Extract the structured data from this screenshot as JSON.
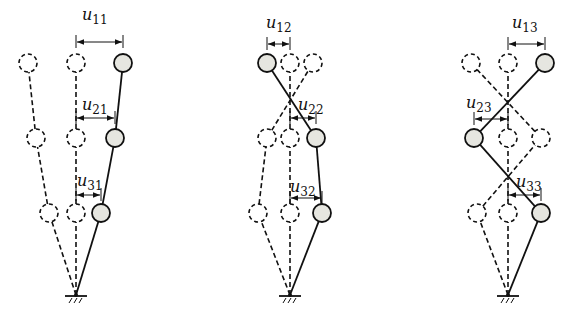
{
  "colors": {
    "stroke": "#111111",
    "mass_fill": "#e6e6e0",
    "background": "#ffffff"
  },
  "figures": [
    {
      "name": "mode-1",
      "base": [
        76,
        295
      ],
      "undeformed_x": 76,
      "rows_y": [
        63,
        138,
        213
      ],
      "solid_nodes": [
        [
          123,
          63
        ],
        [
          115,
          138
        ],
        [
          101,
          213
        ]
      ],
      "dashed_shapes": [
        [
          [
            28,
            63
          ],
          [
            36,
            138
          ],
          [
            49,
            213
          ]
        ]
      ],
      "labels": [
        {
          "symbol": "u",
          "sub": "11",
          "x": 82,
          "y": 20,
          "arrow": [
            76,
            123,
            42
          ]
        },
        {
          "symbol": "u",
          "sub": "21",
          "x": 82,
          "y": 110,
          "arrow": [
            76,
            115,
            118
          ]
        },
        {
          "symbol": "u",
          "sub": "31",
          "x": 77,
          "y": 186,
          "arrow": [
            76,
            101,
            195
          ]
        }
      ]
    },
    {
      "name": "mode-2",
      "base": [
        290,
        295
      ],
      "undeformed_x": 290,
      "rows_y": [
        63,
        138,
        213
      ],
      "solid_nodes": [
        [
          267,
          63
        ],
        [
          316,
          138
        ],
        [
          322,
          213
        ]
      ],
      "dashed_shapes": [
        [
          [
            313,
            63
          ],
          [
            267,
            138
          ],
          [
            258,
            213
          ]
        ]
      ],
      "labels": [
        {
          "symbol": "u",
          "sub": "12",
          "x": 266,
          "y": 28,
          "arrow": [
            267,
            290,
            44
          ]
        },
        {
          "symbol": "u",
          "sub": "22",
          "x": 298,
          "y": 110,
          "arrow": [
            290,
            316,
            118
          ]
        },
        {
          "symbol": "u",
          "sub": "32",
          "x": 290,
          "y": 192,
          "arrow": [
            290,
            322,
            198
          ]
        }
      ]
    },
    {
      "name": "mode-3",
      "base": [
        508,
        295
      ],
      "undeformed_x": 508,
      "rows_y": [
        63,
        138,
        213
      ],
      "solid_nodes": [
        [
          545,
          63
        ],
        [
          474,
          138
        ],
        [
          541,
          213
        ]
      ],
      "dashed_shapes": [
        [
          [
            471,
            63
          ],
          [
            541,
            138
          ],
          [
            477,
            213
          ]
        ]
      ],
      "labels": [
        {
          "symbol": "u",
          "sub": "13",
          "x": 512,
          "y": 28,
          "arrow": [
            508,
            545,
            44
          ]
        },
        {
          "symbol": "u",
          "sub": "23",
          "x": 466,
          "y": 108,
          "arrow": [
            474,
            508,
            119
          ]
        },
        {
          "symbol": "u",
          "sub": "33",
          "x": 516,
          "y": 187,
          "arrow": [
            508,
            541,
            195
          ]
        }
      ]
    }
  ]
}
